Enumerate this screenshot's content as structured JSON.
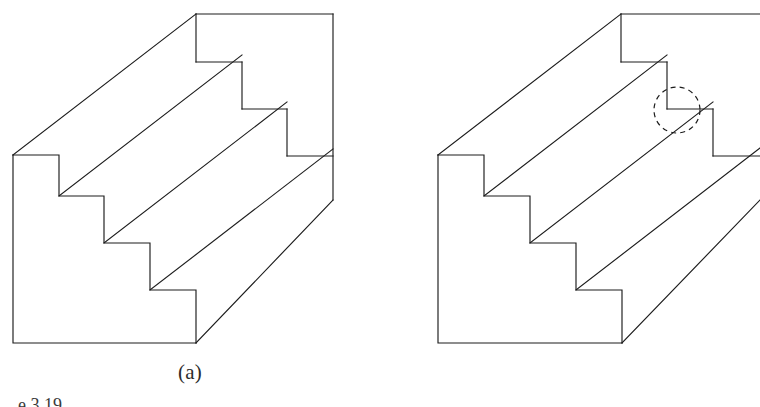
{
  "page": {
    "width": 760,
    "height": 407,
    "background": "#ffffff",
    "ink_color": "#1c1c1c",
    "kind": "line-art-figure-pair"
  },
  "figures": [
    {
      "id": "a",
      "caption": "(a)",
      "subject": "isometric staircase block, four treads, complete solid",
      "has_callout": false,
      "cropped_at_right_edge": false
    },
    {
      "id": "b",
      "caption": "(b)",
      "subject": "isometric staircase block, four treads, with highlighted corner defect",
      "has_callout": true,
      "callout": {
        "shape": "dashed-circle",
        "cx": 297,
        "cy": 110,
        "r": 23,
        "stroke": "#1c1c1c",
        "dash": "5 4.2"
      },
      "cropped_at_right_edge": true
    }
  ],
  "figure_number_partial": "e 3.19",
  "geometry": {
    "a": {
      "outline": "13,155 13,343 196,343 333,200 333,14 196,14 196,14",
      "left_face": [
        [
          13,
          155
        ],
        [
          13,
          343
        ],
        [
          196,
          343
        ],
        [
          196,
          290
        ],
        [
          150,
          290
        ],
        [
          150,
          243
        ],
        [
          104,
          243
        ],
        [
          104,
          196
        ],
        [
          59,
          196
        ],
        [
          59,
          155
        ]
      ],
      "top_back_edge": [
        [
          196,
          14
        ],
        [
          333,
          14
        ]
      ],
      "right_edge": [
        [
          333,
          14
        ],
        [
          333,
          200
        ]
      ],
      "tread_diagonals": [
        {
          "from": [
            13,
            155
          ],
          "to": [
            196,
            14
          ]
        },
        {
          "from": [
            59,
            196
          ],
          "to": [
            242,
            55
          ]
        },
        {
          "from": [
            104,
            243
          ],
          "to": [
            287,
            102
          ]
        },
        {
          "from": [
            150,
            290
          ],
          "to": [
            333,
            149
          ]
        },
        {
          "from": [
            196,
            343
          ],
          "to": [
            333,
            200
          ]
        }
      ],
      "risers": [
        {
          "from": [
            196,
            14
          ],
          "to": [
            196,
            62
          ]
        },
        {
          "from": [
            242,
            55
          ],
          "to": [
            242,
            103
          ]
        },
        {
          "from": [
            287,
            102
          ],
          "to": [
            287,
            150
          ]
        }
      ]
    },
    "b": {
      "left_face": [
        [
          58,
          155
        ],
        [
          58,
          343
        ],
        [
          242,
          343
        ],
        [
          242,
          290
        ],
        [
          196,
          290
        ],
        [
          196,
          243
        ],
        [
          150,
          243
        ],
        [
          150,
          196
        ],
        [
          104,
          196
        ],
        [
          104,
          155
        ]
      ],
      "tread_diagonals": [
        {
          "from": [
            58,
            155
          ],
          "to": [
            241,
            14
          ]
        },
        {
          "from": [
            104,
            196
          ],
          "to": [
            287,
            55
          ]
        },
        {
          "from": [
            150,
            243
          ],
          "to": [
            333,
            102
          ]
        },
        {
          "from": [
            196,
            290
          ],
          "to": [
            379,
            149
          ]
        },
        {
          "from": [
            242,
            343
          ],
          "to": [
            379,
            200
          ]
        }
      ]
    }
  }
}
